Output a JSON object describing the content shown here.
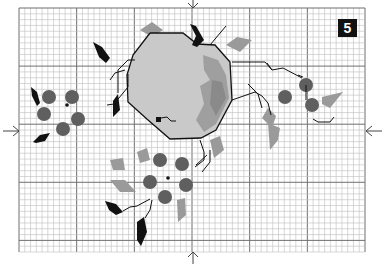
{
  "pattern": {
    "type": "cross-stitch chart",
    "page_number": "5",
    "grid": {
      "x0": 19,
      "y0": 8,
      "x1": 365,
      "y1": 252,
      "cell": 5.8,
      "major_every": 10
    },
    "center_markers": {
      "x": 193,
      "y": 131
    },
    "colors": {
      "grid_minor": "#bdbdbd",
      "grid_major": "#6f6f6f",
      "apple_light": "#c8c8c8",
      "apple_mid": "#a5a5a5",
      "apple_dark": "#8a8a8a",
      "berry": "#5e5e5e",
      "leaf_gray": "#999999",
      "leaf_black": "#111111",
      "backstitch": "#111111",
      "badge_bg": "#111111",
      "badge_text": "#ffffff"
    }
  }
}
